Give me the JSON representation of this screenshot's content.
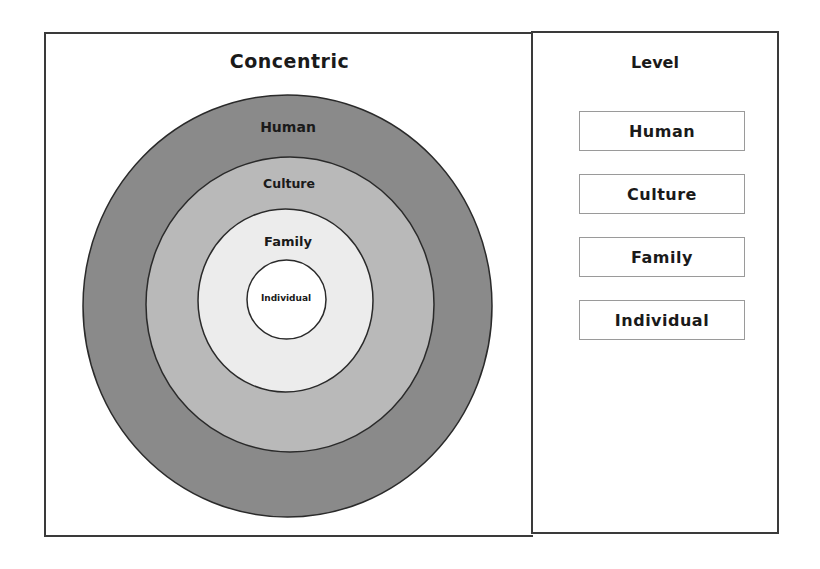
{
  "left_panel": {
    "title": "Concentric"
  },
  "right_panel": {
    "title": "Level",
    "levels": [
      {
        "label": "Human"
      },
      {
        "label": "Culture"
      },
      {
        "label": "Family"
      },
      {
        "label": "Individual"
      }
    ]
  },
  "rings": [
    {
      "label": "Human",
      "fill": "#8a8a8a"
    },
    {
      "label": "Culture",
      "fill": "#b9b9b9"
    },
    {
      "label": "Family",
      "fill": "#ececec"
    },
    {
      "label": "Individual",
      "fill": "#ffffff"
    }
  ],
  "colors": {
    "outline": "#2a2a2a",
    "box_border": "#9a9a9a",
    "panel_border": "#3a3a3a"
  }
}
